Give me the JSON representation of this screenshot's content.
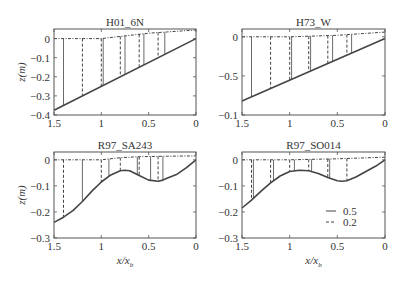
{
  "chart_data": [
    {
      "type": "line",
      "title": "H01_6N",
      "xlabel": "",
      "ylabel": "z(m)",
      "xlim": [
        1.5,
        0
      ],
      "ylim": [
        -0.4,
        0.05
      ],
      "xticks": [
        1.5,
        1,
        0.5,
        0
      ],
      "xtick_labels": [
        "1.5",
        "1",
        "0.5",
        "0"
      ],
      "yticks": [
        0,
        -0.1,
        -0.2,
        -0.3,
        -0.4
      ],
      "ytick_labels": [
        "0",
        "-0.1",
        "-0.2",
        "-0.3",
        "-0.4"
      ],
      "grid": false,
      "frame": {
        "left": 54,
        "right": 196,
        "top": 29,
        "bottom": 115
      },
      "bed": {
        "x": [
          1.5,
          0
        ],
        "z": [
          -0.375,
          0.0
        ]
      },
      "surface": {
        "x": [
          1.5,
          1.0,
          0.5,
          0.3,
          0.0
        ],
        "z": [
          0.0,
          0.0,
          0.028,
          0.035,
          0.045
        ]
      },
      "profiles": [
        {
          "x": 1.4,
          "style": "solid"
        },
        {
          "x": 1.2,
          "style": "dashed"
        },
        {
          "x": 1.0,
          "style": "dashed"
        },
        {
          "x": 0.98,
          "style": "solid"
        },
        {
          "x": 0.8,
          "style": "dashed"
        },
        {
          "x": 0.75,
          "style": "solid"
        },
        {
          "x": 0.6,
          "style": "dashed"
        },
        {
          "x": 0.55,
          "style": "solid"
        },
        {
          "x": 0.4,
          "style": "dashed"
        },
        {
          "x": 0.33,
          "style": "solid"
        }
      ]
    },
    {
      "type": "line",
      "title": "H73_W",
      "xlabel": "",
      "ylabel": "",
      "xlim": [
        1.5,
        0
      ],
      "ylim": [
        -0.1,
        0.01
      ],
      "xticks": [
        1.5,
        1,
        0.5,
        0
      ],
      "xtick_labels": [
        "1.5",
        "1",
        "0.5",
        "0"
      ],
      "yticks": [
        0,
        -0.05,
        -0.1
      ],
      "ytick_labels": [
        "0",
        "-0.5",
        "-0.1"
      ],
      "grid": false,
      "frame": {
        "left": 242,
        "right": 385,
        "top": 29,
        "bottom": 115
      },
      "bed": {
        "x": [
          1.5,
          0
        ],
        "z": [
          -0.082,
          -0.002
        ]
      },
      "surface": {
        "x": [
          1.5,
          1.0,
          0.5,
          0.0
        ],
        "z": [
          0.0,
          0.0,
          0.002,
          0.006
        ]
      },
      "profiles": [
        {
          "x": 1.4,
          "style": "solid"
        },
        {
          "x": 1.2,
          "style": "dashed"
        },
        {
          "x": 1.0,
          "style": "dashed"
        },
        {
          "x": 0.98,
          "style": "solid"
        },
        {
          "x": 0.8,
          "style": "dashed"
        },
        {
          "x": 0.78,
          "style": "solid"
        },
        {
          "x": 0.6,
          "style": "dashed"
        },
        {
          "x": 0.55,
          "style": "solid"
        },
        {
          "x": 0.4,
          "style": "dashed"
        },
        {
          "x": 0.35,
          "style": "solid"
        }
      ]
    },
    {
      "type": "line",
      "title": "R97_SA243",
      "xlabel": "x/x_b",
      "ylabel": "z(m)",
      "xlim": [
        1.5,
        0
      ],
      "ylim": [
        -0.3,
        0.03
      ],
      "xticks": [
        1.5,
        1,
        0.5,
        0
      ],
      "xtick_labels": [
        "1.5",
        "1",
        "0.5",
        "0"
      ],
      "yticks": [
        0,
        -0.1,
        -0.2,
        -0.3
      ],
      "ytick_labels": [
        "0",
        "-0.1",
        "-0.2",
        "-0.3"
      ],
      "grid": false,
      "frame": {
        "left": 54,
        "right": 196,
        "top": 152,
        "bottom": 238
      },
      "bed": {
        "x": [
          1.5,
          1.4,
          1.3,
          1.2,
          1.1,
          1.0,
          0.9,
          0.8,
          0.75,
          0.7,
          0.6,
          0.5,
          0.4,
          0.35,
          0.3,
          0.2,
          0.1,
          0.0
        ],
        "z": [
          -0.24,
          -0.22,
          -0.195,
          -0.16,
          -0.12,
          -0.085,
          -0.058,
          -0.042,
          -0.04,
          -0.042,
          -0.06,
          -0.078,
          -0.082,
          -0.078,
          -0.07,
          -0.055,
          -0.03,
          0.0
        ]
      },
      "surface": {
        "x": [
          1.5,
          1.0,
          0.8,
          0.6,
          0.3,
          0.0
        ],
        "z": [
          0.0,
          0.0,
          0.008,
          0.012,
          0.014,
          0.015
        ]
      },
      "profiles": [
        {
          "x": 1.4,
          "style": "dashed"
        },
        {
          "x": 1.2,
          "style": "solid"
        },
        {
          "x": 1.0,
          "style": "dashed"
        },
        {
          "x": 0.92,
          "style": "solid"
        },
        {
          "x": 0.8,
          "style": "dashed"
        },
        {
          "x": 0.62,
          "style": "solid"
        },
        {
          "x": 0.6,
          "style": "dashed"
        },
        {
          "x": 0.48,
          "style": "solid"
        },
        {
          "x": 0.4,
          "style": "dashed"
        },
        {
          "x": 0.35,
          "style": "solid"
        }
      ]
    },
    {
      "type": "line",
      "title": "R97_SO014",
      "xlabel": "x/x_b",
      "ylabel": "",
      "xlim": [
        1.5,
        0
      ],
      "ylim": [
        -0.3,
        0.03
      ],
      "xticks": [
        1.5,
        1,
        0.5,
        0
      ],
      "xtick_labels": [
        "1.5",
        "1",
        "0.5",
        "0"
      ],
      "yticks": [
        0,
        -0.1,
        -0.2,
        -0.3
      ],
      "ytick_labels": [
        "0",
        "-0.1",
        "-0.2",
        "-0.3"
      ],
      "grid": false,
      "frame": {
        "left": 242,
        "right": 385,
        "top": 152,
        "bottom": 238
      },
      "bed": {
        "x": [
          1.5,
          1.4,
          1.3,
          1.2,
          1.1,
          1.0,
          0.9,
          0.8,
          0.7,
          0.6,
          0.5,
          0.45,
          0.4,
          0.3,
          0.2,
          0.1,
          0.0
        ],
        "z": [
          -0.185,
          -0.155,
          -0.12,
          -0.088,
          -0.062,
          -0.045,
          -0.04,
          -0.042,
          -0.052,
          -0.068,
          -0.08,
          -0.082,
          -0.08,
          -0.065,
          -0.045,
          -0.025,
          0.0
        ]
      },
      "surface": {
        "x": [
          1.5,
          1.0,
          0.5,
          0.0
        ],
        "z": [
          0.0,
          0.0,
          0.004,
          0.01
        ]
      },
      "profiles": [
        {
          "x": 1.4,
          "style": "dashed"
        },
        {
          "x": 1.38,
          "style": "solid"
        },
        {
          "x": 1.2,
          "style": "dashed"
        },
        {
          "x": 1.17,
          "style": "solid"
        },
        {
          "x": 1.0,
          "style": "dashed"
        },
        {
          "x": 0.95,
          "style": "solid"
        },
        {
          "x": 0.8,
          "style": "dashed"
        },
        {
          "x": 0.77,
          "style": "solid"
        },
        {
          "x": 0.6,
          "style": "dashed"
        },
        {
          "x": 0.58,
          "style": "solid"
        },
        {
          "x": 0.4,
          "style": "dashed"
        }
      ],
      "legend": {
        "position": "lower right",
        "entries": [
          {
            "label": "0.5",
            "style": "solid"
          },
          {
            "label": "0.2",
            "style": "dashed"
          }
        ]
      }
    }
  ],
  "colors": {
    "line": "#444444",
    "axis": "#555555",
    "text": "#333333",
    "background": "#ffffff"
  }
}
